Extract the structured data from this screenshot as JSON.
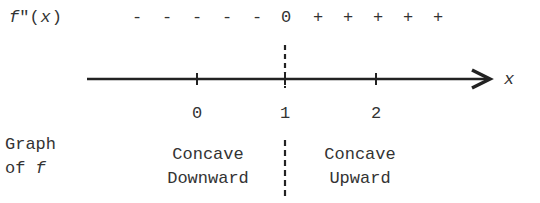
{
  "diagram": {
    "type": "sign-chart",
    "row_label": {
      "func": "f",
      "primes": "\"",
      "arg": "(x)"
    },
    "signs": [
      "-",
      "-",
      "-",
      "-",
      "-",
      "0",
      "+",
      "+",
      "+",
      "+",
      "+"
    ],
    "axis": {
      "variable": "x",
      "ticks": [
        {
          "value": "0"
        },
        {
          "value": "1"
        },
        {
          "value": "2"
        }
      ]
    },
    "graph_label": {
      "line1": "Graph",
      "line2_prefix": "of ",
      "line2_func": "f"
    },
    "regions": [
      {
        "line1": "Concave",
        "line2": "Downward"
      },
      {
        "line1": "Concave",
        "line2": "Upward"
      }
    ],
    "colors": {
      "ink": "#222222",
      "text": "#333333",
      "background": "#ffffff"
    }
  }
}
